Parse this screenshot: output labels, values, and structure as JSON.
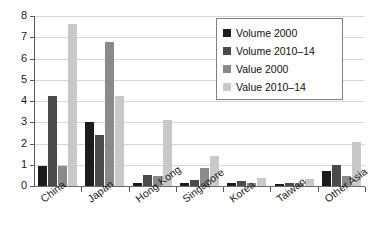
{
  "chart_data": {
    "type": "bar",
    "title": "",
    "xlabel": "",
    "ylabel": "",
    "ylim": [
      0,
      8
    ],
    "yticks": [
      "0",
      "1",
      "2",
      "3",
      "4",
      "5",
      "6",
      "7",
      "8"
    ],
    "grid": true,
    "legend_position": "top-right",
    "categories": [
      "China",
      "Japan",
      "Hong Kong",
      "Singapore",
      "Korea",
      "Taiwan",
      "Other Asia"
    ],
    "series": [
      {
        "name": "Volume 2000",
        "color": "#1c1c1c",
        "values": [
          0.95,
          3.0,
          0.15,
          0.15,
          0.12,
          0.1,
          0.7
        ]
      },
      {
        "name": "Volume 2010–14",
        "color": "#4a4a4a",
        "values": [
          4.25,
          2.38,
          0.5,
          0.27,
          0.25,
          0.15,
          1.0
        ]
      },
      {
        "name": "Value 2000",
        "color": "#8a8a8a",
        "values": [
          0.95,
          6.8,
          0.45,
          0.85,
          0.12,
          0.15,
          0.45
        ]
      },
      {
        "name": "Value 2010–14",
        "color": "#c9c9c9",
        "values": [
          7.62,
          4.25,
          3.1,
          1.42,
          0.4,
          0.35,
          2.05
        ]
      }
    ]
  },
  "legend": {
    "items": [
      {
        "label": "Volume 2000"
      },
      {
        "label": "Volume 2010–14"
      },
      {
        "label": "Value 2000"
      },
      {
        "label": "Value 2010–14"
      }
    ]
  }
}
